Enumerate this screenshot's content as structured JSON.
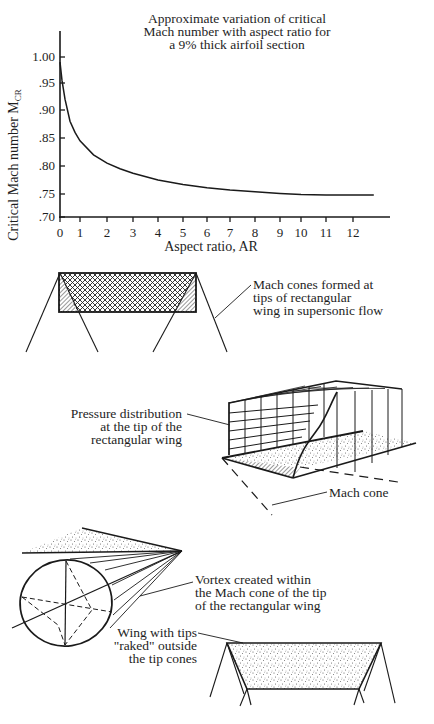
{
  "chart_data": {
    "type": "line",
    "title": "Approximate variation of critical Mach number with aspect ratio for a 9% thick airfoil section",
    "title_lines": [
      "Approximate variation of critical",
      "Mach number with aspect ratio for",
      "a 9% thick airfoil section"
    ],
    "xlabel": "Aspect ratio, AR",
    "ylabel": "Critical Mach number M",
    "ylabel_subscript": "CR",
    "x_ticks": [
      "0",
      "1",
      "2",
      "3",
      "4",
      "5",
      "6",
      "7",
      "8",
      "9",
      "10",
      "11",
      "12"
    ],
    "y_ticks": [
      "1.00",
      ".95",
      ".90",
      ".85",
      ".80",
      ".75",
      ".70"
    ],
    "xlim": [
      0,
      13
    ],
    "ylim": [
      0.7,
      1.03
    ],
    "grid": false,
    "legend": null,
    "series": [
      {
        "name": "Critical Mach number",
        "x": [
          0,
          0.1,
          0.25,
          0.5,
          0.75,
          1,
          1.5,
          2,
          2.5,
          3,
          4,
          5,
          6,
          7,
          8,
          9,
          10,
          11,
          12,
          12.8
        ],
        "y": [
          0.99,
          0.955,
          0.92,
          0.88,
          0.86,
          0.845,
          0.82,
          0.805,
          0.795,
          0.787,
          0.775,
          0.767,
          0.761,
          0.757,
          0.754,
          0.751,
          0.749,
          0.748,
          0.748,
          0.748
        ]
      }
    ]
  },
  "diagrams": {
    "mach_cones": {
      "label_lines": [
        "Mach cones formed at",
        "tips of rectangular",
        "wing in supersonic flow"
      ]
    },
    "pressure_distribution": {
      "label_lines": [
        "Pressure distribution",
        "at the tip of the",
        "rectangular wing"
      ],
      "mach_cone_label": "Mach cone"
    },
    "vortex": {
      "label_lines": [
        "Vortex created within",
        "the Mach cone of the tip",
        "of the rectangular wing"
      ]
    },
    "raked_wing": {
      "label_lines": [
        "Wing with tips",
        "\"raked\" outside",
        "the tip cones"
      ]
    }
  }
}
